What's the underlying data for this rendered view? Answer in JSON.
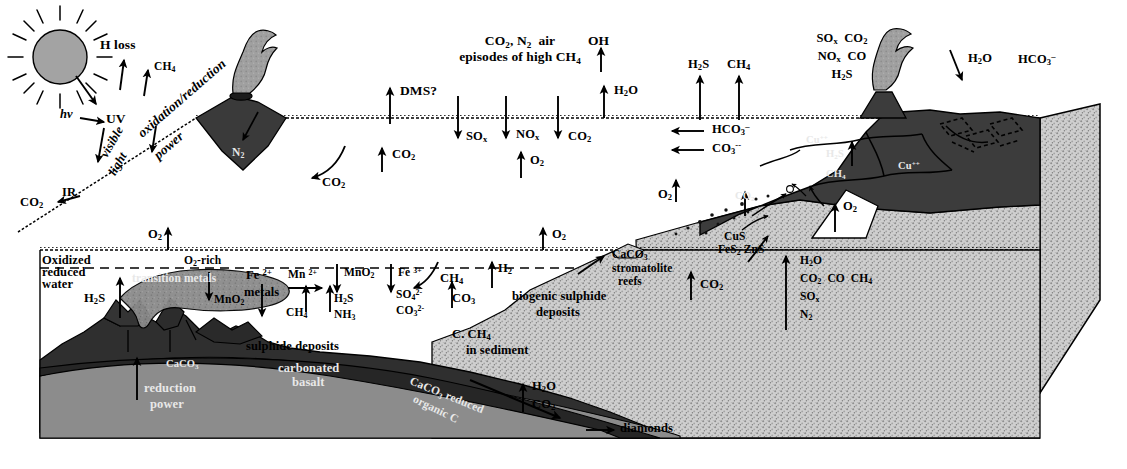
{
  "diagram": {
    "domain": "geoscience-schematic"
  },
  "palette": {
    "background": "#ffffff",
    "ink": "#000000",
    "dark_crust": "#3d3d3d",
    "darker_crust": "#2a2a2a",
    "mid_grey": "#7b7b7b",
    "light_stipple": "#c9c9c9",
    "plume_grey": "#9a9a9a",
    "sun_grey": "#9e9e9e",
    "white_fill": "#ffffff"
  },
  "sun": {
    "name": "sun",
    "hv_label": "hv",
    "rays": 12
  },
  "atmosphere": {
    "h_loss": "H loss",
    "ch4": "CH4",
    "uv": "UV",
    "visible_light_line1": "visible",
    "visible_light_line2": "light",
    "ir": "IR",
    "co2_ir": "CO2",
    "oxidation_reduction": "oxidation/reduction",
    "power": "power",
    "air_line1": "CO2, N2  air",
    "air_line2": "episodes of high CH4",
    "oh": "OH",
    "h2o_up": "H2O",
    "dms": "DMS?",
    "co2_curl": "CO2",
    "co2_up_mid": "CO2",
    "o2_up_mid": "O2",
    "h2s_up": "H2S",
    "ch4_up": "CH4",
    "volcano_island_label": "N2"
  },
  "sea_surface_fluxes": {
    "down": [
      {
        "label": "SOx"
      },
      {
        "label": "NOx"
      },
      {
        "label": "CO2"
      }
    ],
    "into_sea_left": [
      {
        "label": "HCO3-"
      },
      {
        "label": "CO3--"
      }
    ]
  },
  "land_volcano": {
    "emissions_line1": "SOx  CO2",
    "emissions_line2": "NOx  CO",
    "emissions_line3": "H2S",
    "rain_h2o": "H2O",
    "rain_hco3": "HCO3-",
    "interior_cu_1": "Cu",
    "interior_cu_2": "Cu",
    "interior_h2s": "H2S",
    "interior_ch4": "CH4",
    "o2_wedge": "O2",
    "o2_shelf": "O2",
    "co2_shelf": "CO2"
  },
  "ocean": {
    "o2_surface_left": "O2",
    "o2_surface_right": "O2",
    "o2_rich": "O2-rich",
    "redox_line1": "Oxidized",
    "redox_line2": "reduced",
    "redox_line3": "water",
    "h2s_vent": "H2S",
    "transition_metals": "transition metals",
    "mno2_down_left": "MnO2",
    "fe2_line1": "Fe 2+",
    "fe2_line2": "metals",
    "mn2": "Mn 2+",
    "ch4": "CH4",
    "h2s": "H2S",
    "nh3": "NH3",
    "mno2_down_right": "MnO2",
    "fe3": "Fe 3+",
    "so4": "SO4 2-",
    "co3": "CO3 2-",
    "ch4_slope": "CH4",
    "co3_slope": "CO3",
    "h2_slope": "H2",
    "c_ch4_line1": "C. CH4",
    "c_ch4_line2": "in sediment",
    "biogenic_line1": "biogenic sulphide",
    "biogenic_line2": "deposits",
    "caco3_line1": "CaCO3",
    "caco3_line2": "stromatolite",
    "caco3_line3": "reefs",
    "co2_shelf_up": "CO2",
    "cus": "CuS",
    "fes2_zns": "FeS2 ZnS"
  },
  "seafloor_crust": {
    "sulphide_deposits": "sulphide deposits",
    "carbonated_basalt_line1": "carbonated",
    "carbonated_basalt_line2": "basalt",
    "caco3_vent": "CaCO3",
    "reduction_power_line1": "reduction",
    "reduction_power_line2": "power",
    "caco3_slab_line1": "CaCO3 reduced",
    "caco3_slab_line2": "organic C",
    "h2o_slab": "H2O",
    "co2_slab": "CO2",
    "diamonds": "diamonds"
  },
  "subduction_outgassing": {
    "h2o": "H2O",
    "co2_co_ch4": "CO2  CO  CH4",
    "sox": "SOx",
    "n2": "N2"
  }
}
